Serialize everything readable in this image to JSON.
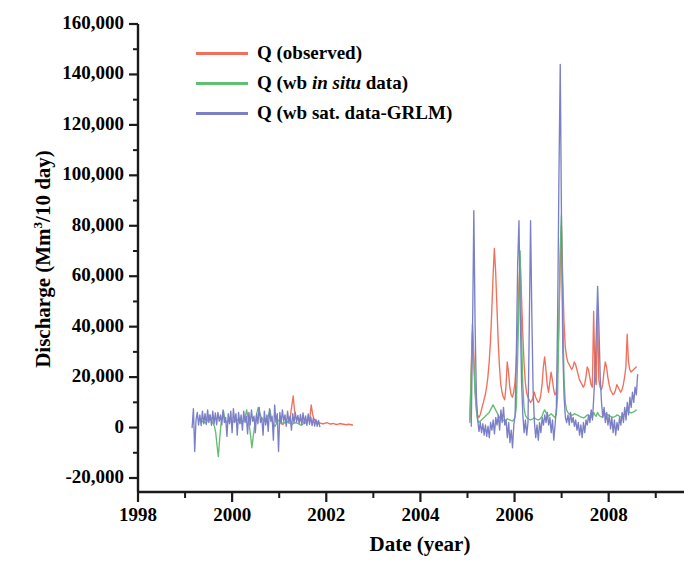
{
  "chart_data": {
    "type": "line",
    "title": "",
    "xlabel": "Date (year)",
    "ylabel": "Discharge (Mm3/10 day)",
    "ylabel_base": "Discharge (Mm",
    "ylabel_sup": "3",
    "ylabel_tail": "/10 day)",
    "xlim": [
      1998,
      2009.6
    ],
    "ylim": [
      -20000,
      160000
    ],
    "grid": false,
    "legend_position": "top-center-left",
    "y_ticks": [
      -20000,
      0,
      20000,
      40000,
      60000,
      80000,
      100000,
      120000,
      140000,
      160000
    ],
    "y_tick_labels": [
      "-20,000",
      "0",
      "20,000",
      "40,000",
      "60,000",
      "80,000",
      "100,000",
      "120,000",
      "140,000",
      "160,000"
    ],
    "y_minor_tick_interval": 10000,
    "x_ticks": [
      1998,
      2000,
      2002,
      2004,
      2006,
      2008
    ],
    "x_tick_labels": [
      "1998",
      "2000",
      "2002",
      "2004",
      "2006",
      "2008"
    ],
    "x_minor_ticks": [
      1999,
      2001,
      2003,
      2005,
      2007,
      2009
    ],
    "colors": {
      "observed": "#F0705C",
      "wb_in_situ": "#62BE72",
      "wb_sat_grlm": "#7B80C6",
      "axis": "#1a1a1a",
      "background": "#ffffff"
    },
    "legend": [
      {
        "label": "Q (observed)",
        "color_key": "observed",
        "italic_part": ""
      },
      {
        "label_pre": "Q (wb ",
        "label_italic": "in situ",
        "label_post": " data)",
        "color_key": "wb_in_situ"
      },
      {
        "label": "Q (wb sat. data-GRLM)",
        "color_key": "wb_sat_grlm",
        "italic_part": ""
      }
    ],
    "series": [
      {
        "name": "Q (observed)",
        "color": "#F0705C",
        "segments": [
          {
            "x_start": 2001.05,
            "x_step": 0.0274,
            "values": [
              1500,
              1200,
              2000,
              1800,
              2500,
              2200,
              3000,
              5000,
              9000,
              12500,
              7000,
              4000,
              3500,
              3800,
              3200,
              2800,
              2500,
              2200,
              2000,
              1800,
              2400,
              3200,
              4200,
              9000,
              5500,
              3500,
              2800,
              2500,
              2200,
              2000,
              1800,
              1600,
              1500,
              1600,
              1800,
              2000,
              1800,
              1500,
              1400,
              1500,
              1700,
              1500,
              1300,
              1200,
              1400,
              1600,
              1500,
              1400,
              1300,
              1200,
              1100,
              1200,
              1300,
              1200,
              1100,
              1000
            ]
          },
          {
            "x_start": 2005.05,
            "x_step": 0.0274,
            "values": [
              3000,
              22000,
              41000,
              30000,
              17000,
              9000,
              5000,
              4000,
              5000,
              7000,
              9000,
              11000,
              13000,
              16000,
              20000,
              26000,
              34000,
              46000,
              60000,
              71000,
              62000,
              48000,
              34000,
              24000,
              17000,
              14000,
              12000,
              11000,
              16000,
              26000,
              22000,
              16000,
              13000,
              12000,
              14000,
              18000,
              26000,
              38000,
              56000,
              67000,
              53000,
              38000,
              26000,
              18000,
              14000,
              12000,
              11000,
              10000,
              10500,
              12000,
              14000,
              12000,
              11000,
              10000,
              10500,
              13000,
              17000,
              24000,
              28000,
              23000,
              17000,
              14000,
              18000,
              22000,
              19000,
              15000,
              13000,
              14000,
              22000,
              40000,
              62000,
              80000,
              60000,
              42000,
              32000,
              28000,
              26000,
              25000,
              24000,
              23000,
              24000,
              26000,
              25000,
              23000,
              21000,
              19000,
              18000,
              17000,
              16000,
              17000,
              20000,
              24000,
              23000,
              20000,
              17000,
              16000,
              46000,
              20000,
              17000,
              47000,
              19000,
              16000,
              15000,
              17000,
              22000,
              26000,
              24000,
              20000,
              17000,
              15000,
              14000,
              13000,
              13500,
              15000,
              17000,
              16000,
              15000,
              14000,
              15000,
              17000,
              20000,
              24000,
              37000,
              26000,
              23000,
              22000,
              22500,
              23000,
              23500,
              24000
            ]
          }
        ]
      },
      {
        "name": "Q (wb in situ data)",
        "color": "#62BE72",
        "segments": [
          {
            "x_start": 1999.35,
            "x_step": 0.0274,
            "values": [
              2000,
              2500,
              2200,
              1800,
              2200,
              3500,
              5000,
              4000,
              2500,
              1500,
              500,
              -2000,
              -7000,
              -11500,
              -5000,
              1000,
              4000,
              6500,
              3500,
              2000,
              2500,
              3000,
              2500,
              2200,
              2000,
              2500,
              3000,
              3500,
              3000,
              2500,
              2000,
              1800,
              2200,
              3000,
              4500,
              7000,
              4000,
              1000,
              -3000,
              -8000,
              -4000,
              0,
              3000,
              6000,
              8000,
              6000,
              4500,
              3500,
              3000,
              2500,
              2000,
              3000,
              5000,
              7000,
              4000,
              2000,
              1000,
              500,
              1500,
              2500,
              3000,
              2500,
              2000,
              1800,
              2000,
              2200,
              2500,
              2000,
              1800,
              1500,
              1200,
              1500,
              1800,
              2000,
              1800,
              1500,
              1200,
              1000,
              1200,
              1500
            ]
          },
          {
            "x_start": 2005.05,
            "x_step": 0.0274,
            "values": [
              2000,
              20000,
              38000,
              26000,
              14000,
              7000,
              3000,
              2000,
              2500,
              3000,
              3500,
              4000,
              4500,
              5000,
              5500,
              6000,
              7000,
              8000,
              9000,
              8000,
              7000,
              6000,
              5000,
              4000,
              3500,
              3000,
              2800,
              2600,
              3000,
              3500,
              3200,
              3000,
              2800,
              2600,
              3000,
              4000,
              8000,
              26000,
              48000,
              70000,
              40000,
              18000,
              8000,
              5000,
              4000,
              3500,
              3200,
              3000,
              3200,
              3500,
              4000,
              3500,
              3200,
              3000,
              3200,
              3800,
              4500,
              6000,
              7000,
              6000,
              5000,
              4500,
              5000,
              5500,
              5000,
              4500,
              4000,
              5000,
              12000,
              40000,
              70000,
              84000,
              48000,
              20000,
              10000,
              7000,
              6000,
              5500,
              5000,
              4800,
              5000,
              5500,
              5200,
              5000,
              4800,
              4500,
              4200,
              4000,
              3800,
              4000,
              4500,
              5000,
              4800,
              4500,
              4200,
              4000,
              6000,
              5000,
              4500,
              6000,
              5000,
              4500,
              4200,
              4500,
              5000,
              5500,
              5200,
              5000,
              4800,
              4500,
              4200,
              4000,
              4200,
              4500,
              5000,
              4800,
              4500,
              4200,
              4500,
              5000,
              5500,
              6000,
              8000,
              6500,
              6000,
              5800,
              6000,
              6200,
              6500,
              7000
            ]
          }
        ]
      },
      {
        "name": "Q (wb sat. data-GRLM)",
        "color": "#7B80C6",
        "segments": [
          {
            "x_start": 1999.15,
            "x_step": 0.0274,
            "values": [
              0,
              7500,
              -9500,
              3000,
              6000,
              1000,
              5000,
              800,
              6500,
              1500,
              5500,
              1200,
              7000,
              2000,
              5000,
              900,
              6500,
              1400,
              5800,
              1100,
              6000,
              2500,
              5000,
              1000,
              7000,
              2000,
              4000,
              -3500,
              5500,
              1500,
              6500,
              -2000,
              7500,
              2000,
              5500,
              -3000,
              6000,
              1500,
              5000,
              -1000,
              6500,
              2000,
              4500,
              -2500,
              6000,
              1000,
              7000,
              2500,
              4500,
              -2000,
              5500,
              1500,
              8000,
              2000,
              4000,
              -3000,
              6500,
              1000,
              5000,
              -1500,
              7500,
              2500,
              4500,
              -5000,
              9000,
              2000,
              5500,
              -9500,
              6000,
              1500,
              7000,
              2500,
              5000,
              500,
              6500,
              2000,
              4500,
              -1000,
              5500,
              1800,
              6000,
              2200,
              4800,
              1500,
              5200,
              1000,
              5800,
              1600,
              4600,
              900,
              5400,
              1300,
              4200,
              800,
              3800,
              600,
              3200,
              500,
              2800,
              400
            ]
          },
          {
            "x_start": 2005.08,
            "x_step": 0.0274,
            "values": [
              500,
              38000,
              86000,
              40000,
              12000,
              3000,
              -1500,
              2000,
              -2000,
              1500,
              -3000,
              1000,
              -3500,
              500,
              -4000,
              2000,
              -1000,
              3000,
              -2500,
              4000,
              1000,
              5000,
              -1000,
              7000,
              2000,
              8000,
              1000,
              3000,
              -4000,
              2000,
              -6000,
              -1000,
              -8000,
              1000,
              5000,
              30000,
              65000,
              82000,
              46000,
              18000,
              5000,
              -2000,
              3000,
              -3000,
              2000,
              40000,
              82000,
              44000,
              14000,
              2000,
              -4000,
              1000,
              -5000,
              2000,
              -2000,
              4000,
              1000,
              5000,
              2000,
              6000,
              1000,
              4000,
              -2000,
              3000,
              -5000,
              1000,
              8000,
              45000,
              100000,
              144000,
              80000,
              30000,
              12000,
              4000,
              2000,
              5000,
              1000,
              6000,
              2000,
              4000,
              500,
              3000,
              -1000,
              2000,
              -3000,
              1000,
              -4000,
              2000,
              -2000,
              3000,
              1000,
              5000,
              2000,
              7000,
              3000,
              12000,
              22000,
              38000,
              56000,
              40000,
              20000,
              10000,
              4000,
              8000,
              2000,
              6000,
              1000,
              5000,
              -500,
              4000,
              -2000,
              3000,
              -3000,
              2000,
              -1000,
              4000,
              1000,
              6000,
              2000,
              8000,
              3000,
              10000,
              5000,
              12000,
              8000,
              14000,
              10000,
              16000,
              13000,
              21000
            ]
          }
        ]
      }
    ]
  },
  "axes": {
    "y_title_text": "Discharge (Mm",
    "y_title_sup": "3",
    "y_title_tail": "/10 day)",
    "x_title": "Date (year)"
  }
}
